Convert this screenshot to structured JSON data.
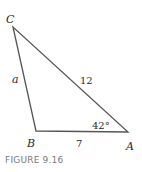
{
  "figure": {
    "caption": "FIGURE 9.16",
    "vertices": {
      "C": {
        "label": "C"
      },
      "B": {
        "label": "B"
      },
      "A": {
        "label": "A"
      }
    },
    "sides": {
      "CB": {
        "label": "a"
      },
      "CA": {
        "label": "12"
      },
      "BA": {
        "label": "7"
      }
    },
    "angles": {
      "A": {
        "label": "42°"
      }
    },
    "colors": {
      "line": "#555555",
      "text": "#2a2a2a",
      "caption": "#7a7a7a"
    }
  }
}
